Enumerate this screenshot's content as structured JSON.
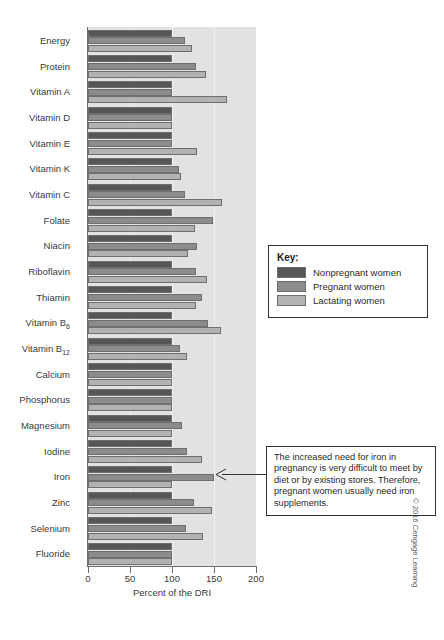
{
  "chart_data": {
    "type": "bar",
    "orientation": "horizontal",
    "title": "",
    "xlabel": "Percent of the DRI",
    "ylabel": "",
    "xlim": [
      0,
      200
    ],
    "xticks": [
      0,
      50,
      100,
      150,
      200
    ],
    "xtick_labels": [
      "0",
      "50",
      "100",
      "150",
      "200"
    ],
    "grid": true,
    "legend_position": "right",
    "legend_title": "Key:",
    "categories": [
      "Energy",
      "Protein",
      "Vitamin A",
      "Vitamin D",
      "Vitamin E",
      "Vitamin K",
      "Vitamin C",
      "Folate",
      "Niacin",
      "Riboflavin",
      "Thiamin",
      "Vitamin B6",
      "Vitamin B12",
      "Calcium",
      "Phosphorus",
      "Magnesium",
      "Iodine",
      "Iron",
      "Zinc",
      "Selenium",
      "Fluoride"
    ],
    "category_labels_html": [
      "Energy",
      "Protein",
      "Vitamin A",
      "Vitamin D",
      "Vitamin E",
      "Vitamin K",
      "Vitamin C",
      "Folate",
      "Niacin",
      "Riboflavin",
      "Thiamin",
      "Vitamin B<sub>6</sub>",
      "Vitamin B<sub>12</sub>",
      "Calcium",
      "Phosphorus",
      "Magnesium",
      "Iodine",
      "Iron",
      "Zinc",
      "Selenium",
      "Fluoride"
    ],
    "series": [
      {
        "name": "Nonpregnant women",
        "color": "#565656",
        "values": [
          100,
          100,
          100,
          100,
          100,
          100,
          100,
          100,
          100,
          100,
          100,
          100,
          100,
          100,
          100,
          100,
          100,
          100,
          100,
          100,
          100
        ]
      },
      {
        "name": "Pregnant women",
        "color": "#8c8c8c",
        "values": [
          116,
          129,
          100,
          100,
          100,
          108,
          116,
          149,
          130,
          129,
          136,
          143,
          110,
          100,
          100,
          112,
          118,
          150,
          126,
          117,
          100
        ]
      },
      {
        "name": "Lactating women",
        "color": "#b2b2b2",
        "values": [
          124,
          141,
          166,
          100,
          130,
          111,
          160,
          127,
          119,
          142,
          128,
          158,
          118,
          100,
          100,
          100,
          136,
          100,
          148,
          137,
          100
        ]
      }
    ]
  },
  "legend": {
    "title": "Key:",
    "entries": [
      {
        "label": "Nonpregnant women",
        "color": "#565656"
      },
      {
        "label": "Pregnant women",
        "color": "#8c8c8c"
      },
      {
        "label": "Lactating women",
        "color": "#b2b2b2"
      }
    ]
  },
  "annotation": {
    "text": "The increased need for iron in pregnancy is very difficult to meet by diet or by existing stores. Therefore, pregnant women usually need iron supplements.",
    "points_to": "Iron"
  },
  "axis": {
    "xlabel": "Percent of the DRI",
    "tick_labels": [
      "0",
      "50",
      "100",
      "150",
      "200"
    ]
  },
  "credit": "© 2016 Cengage Learning",
  "colors": {
    "plot_background": "#e2e2e2",
    "gridline": "#f0f0f0",
    "axis": "#6e6e6e",
    "text": "#3a3a3a",
    "bar_border": "#6f6f6f"
  }
}
